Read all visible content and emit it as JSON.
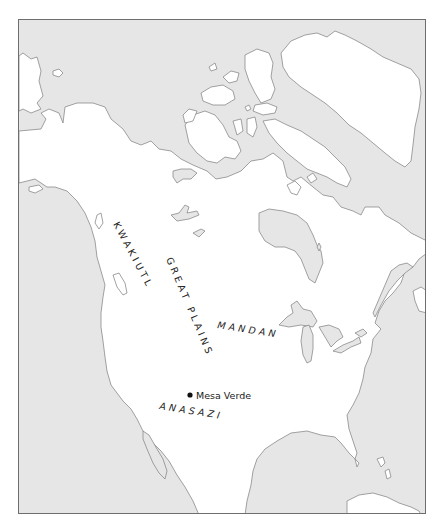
{
  "map": {
    "colors": {
      "sea": "#e6e6e6",
      "land": "#ffffff",
      "coastline": "#8a8a8a",
      "frame": "#6e6e6e",
      "text": "#222222"
    },
    "regions": [
      {
        "name": "KWAKIUTL",
        "x": 115,
        "y": 222,
        "rotate": 62
      },
      {
        "name": "GREAT PLAINS",
        "x": 166,
        "y": 258,
        "rotate": 67
      },
      {
        "name": "MANDAN",
        "x": 215,
        "y": 330,
        "rotate": 9
      },
      {
        "name": "ANASAZI",
        "x": 158,
        "y": 406,
        "rotate": 9
      }
    ],
    "sites": [
      {
        "name": "Mesa Verde",
        "marker": "filled-circle",
        "x": 189,
        "y": 394
      }
    ]
  }
}
